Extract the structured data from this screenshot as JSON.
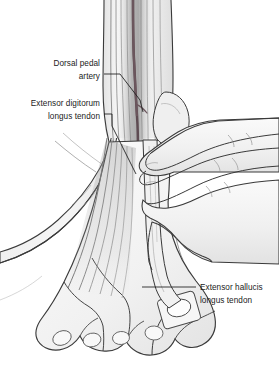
{
  "figure": {
    "background_color": "#ffffff",
    "ink_color": "#1b1b1b",
    "skin_fill": "#f2f2f2",
    "skin_shadow": "#dcdcdc",
    "artery_color": "#5e4b52",
    "tendon_fill": "#ededed",
    "width": 279,
    "height": 381
  },
  "labels": [
    {
      "id": "dorsal-pedal-artery",
      "name": "Dorsal pedal artery",
      "line1": "Dorsal pedal",
      "line2": "artery",
      "align": "right",
      "text_x": 100,
      "text_y1": 62,
      "text_y2": 76
    },
    {
      "id": "extensor-digitorum-longus-tendon",
      "name": "Extensor digitorum longus tendon",
      "line1": "Extensor digitorum",
      "line2": "longus tendon",
      "align": "right",
      "text_x": 100,
      "text_y1": 102,
      "text_y2": 116
    },
    {
      "id": "extensor-hallucis-longus-tendon",
      "name": "Extensor hallucis longus tendon",
      "line1": "Extensor hallucis",
      "line2": "longus tendon",
      "align": "left",
      "text_x": 200,
      "text_y1": 285,
      "text_y2": 299
    }
  ],
  "anatomy": {
    "structures": [
      "lower leg",
      "ankle",
      "lateral malleolus",
      "dorsum of foot",
      "toes with toenails",
      "extensor digitorum longus tendons",
      "extensor hallucis longus tendon",
      "dorsal pedal artery",
      "examiner right hand fingers",
      "examiner supporting hand and forearm"
    ]
  }
}
